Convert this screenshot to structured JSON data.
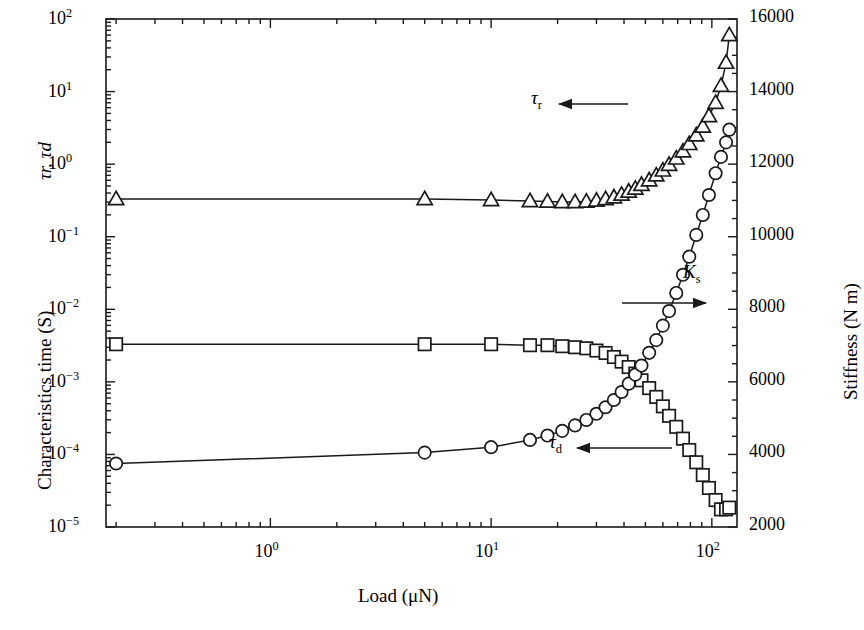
{
  "figure": {
    "background": "#ffffff",
    "line_color": "#1a1a1a"
  },
  "chart_data": {
    "type": "line",
    "title": "",
    "xlabel": "Load (μN)",
    "ylabel": "Characteristics time (S)",
    "ylabel_secondary": "Stiffness (N m)",
    "ylabel_left_upper": "τr, τd",
    "xscale": "log",
    "yscale": "log",
    "y2scale": "linear",
    "xlim": [
      0.18,
      130
    ],
    "ylim": [
      1e-05,
      100
    ],
    "y2lim": [
      2000,
      16000
    ],
    "grid": false,
    "legend_position": "inline-annotations",
    "xticks": [
      "10⁰",
      "10¹",
      "10²"
    ],
    "xtick_values": [
      1,
      10,
      100
    ],
    "yticks": [
      "10²",
      "10¹",
      "10⁰",
      "10⁻¹",
      "10⁻²",
      "10⁻³",
      "10⁻⁴",
      "10⁻⁵"
    ],
    "ytick_values": [
      100,
      10,
      1,
      0.1,
      0.01,
      0.001,
      0.0001,
      1e-05
    ],
    "y2ticks": [
      "16000",
      "14000",
      "12000",
      "10000",
      "8000",
      "6000",
      "4000",
      "2000"
    ],
    "y2tick_values": [
      16000,
      14000,
      12000,
      10000,
      8000,
      6000,
      4000,
      2000
    ],
    "annotations": [
      {
        "text": "τ",
        "sub": "r",
        "arrow": "left",
        "x_px": 533,
        "y_px": 104,
        "arrow_to_px": 628
      },
      {
        "text": "K",
        "sub": "s",
        "arrow": "right",
        "x_px": 683,
        "y_px": 303,
        "arrow_to_px": 700
      },
      {
        "text": "τ",
        "sub": "d",
        "arrow": "left",
        "x_px": 551,
        "y_px": 448,
        "arrow_to_px": 672
      }
    ],
    "series": [
      {
        "name": "τr",
        "marker": "triangle",
        "axis": "left",
        "x": [
          0.2,
          5.0,
          10.0,
          15.0,
          18.0,
          21.0,
          24.0,
          27.0,
          30.0,
          33.0,
          36.0,
          39.0,
          42.0,
          45.0,
          48.0,
          52.0,
          56.0,
          60.0,
          64.0,
          69.0,
          74.0,
          79.0,
          85.0,
          91.0,
          97.0,
          104.0,
          110.0,
          116.0,
          120.0
        ],
        "y": [
          0.33,
          0.33,
          0.32,
          0.31,
          0.305,
          0.3,
          0.3,
          0.305,
          0.315,
          0.33,
          0.35,
          0.38,
          0.42,
          0.46,
          0.52,
          0.6,
          0.7,
          0.82,
          0.98,
          1.2,
          1.5,
          1.9,
          2.5,
          3.3,
          4.6,
          7.0,
          12.0,
          25.0,
          60.0
        ]
      },
      {
        "name": "τd",
        "marker": "square",
        "axis": "left",
        "x": [
          0.2,
          5.0,
          10.0,
          15.0,
          18.0,
          21.0,
          24.0,
          27.0,
          30.0,
          33.0,
          36.0,
          39.0,
          42.0,
          45.0,
          48.0,
          52.0,
          56.0,
          60.0,
          64.0,
          69.0,
          74.0,
          79.0,
          85.0,
          91.0,
          97.0,
          104.0,
          110.0,
          116.0,
          120.0
        ],
        "y": [
          0.0033,
          0.0033,
          0.0033,
          0.0032,
          0.0032,
          0.0031,
          0.003,
          0.0029,
          0.0027,
          0.0025,
          0.0022,
          0.0019,
          0.0016,
          0.0013,
          0.00105,
          0.00082,
          0.00062,
          0.00046,
          0.00034,
          0.00024,
          0.000165,
          0.000115,
          7.8e-05,
          5.2e-05,
          3.45e-05,
          2.35e-05,
          1.75e-05,
          1.75e-05,
          1.85e-05
        ]
      },
      {
        "name": "Ks",
        "marker": "circle",
        "axis": "right",
        "x": [
          0.2,
          5.0,
          10.0,
          15.0,
          18.0,
          21.0,
          24.0,
          27.0,
          30.0,
          33.0,
          36.0,
          39.0,
          42.0,
          45.0,
          48.0,
          52.0,
          56.0,
          60.0,
          64.0,
          69.0,
          74.0,
          79.0,
          85.0,
          91.0,
          97.0,
          104.0,
          110.0,
          116.0,
          120.0
        ],
        "y": [
          3750,
          4050,
          4200,
          4400,
          4520,
          4650,
          4800,
          4950,
          5120,
          5300,
          5500,
          5720,
          5950,
          6200,
          6450,
          6800,
          7150,
          7550,
          7950,
          8450,
          8950,
          9450,
          10050,
          10600,
          11150,
          11750,
          12200,
          12600,
          12950
        ]
      }
    ]
  },
  "axes_geometry": {
    "left_px": 106,
    "right_px": 737,
    "top_px": 19,
    "bottom_px": 527
  }
}
